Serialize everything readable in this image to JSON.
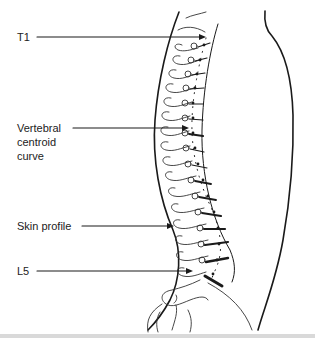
{
  "figure": {
    "type": "lateral spine diagram",
    "labels": {
      "t1": "T1",
      "centroid_line1": "Vertebral",
      "centroid_line2": "centroid",
      "centroid_line3": "curve",
      "skin": "Skin profile",
      "l5": "L5"
    },
    "colors": {
      "ink": "#1a1a1a",
      "background": "#ffffff",
      "bottom_bar": "#d9d9d9"
    }
  }
}
